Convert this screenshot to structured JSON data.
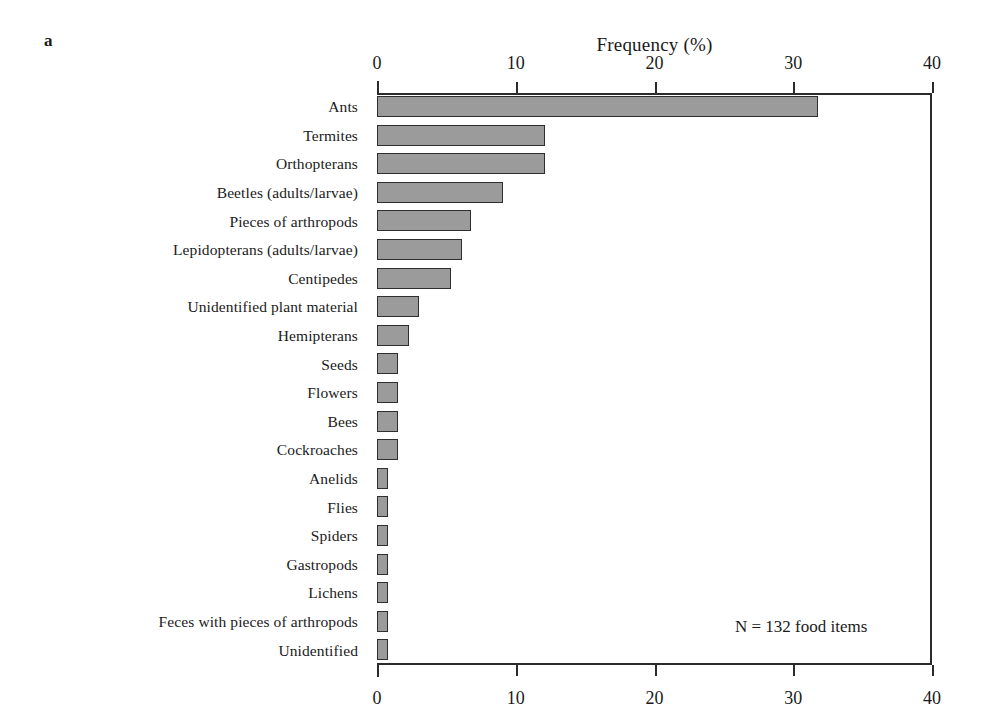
{
  "panel": {
    "label": "a"
  },
  "annotation": {
    "text": "N = 132 food items"
  },
  "style": {
    "bar_fill": "#9b9b9b",
    "bar_border": "#2e2e2e",
    "axis_color": "#2b2b2b",
    "background": "#ffffff"
  },
  "chart_data": {
    "type": "bar",
    "orientation": "horizontal",
    "title": "",
    "xlabel": "Frequency (%)",
    "ylabel": "",
    "xlim": [
      0,
      40
    ],
    "xticks": [
      0,
      10,
      20,
      30,
      40
    ],
    "xticklabels": [
      "0",
      "10",
      "20",
      "30",
      "40"
    ],
    "xticks_both_axes": true,
    "grid": false,
    "legend": null,
    "annotations": [
      "N = 132 food items"
    ],
    "categories": [
      "Ants",
      "Termites",
      "Orthopterans",
      "Beetles (adults/larvae)",
      "Pieces of arthropods",
      "Lepidopterans (adults/larvae)",
      "Centipedes",
      "Unidentified plant material",
      "Hemipterans",
      "Seeds",
      "Flowers",
      "Bees",
      "Cockroaches",
      "Anelids",
      "Flies",
      "Spiders",
      "Gastropods",
      "Lichens",
      "Feces with pieces of arthropods",
      "Unidentified"
    ],
    "values": [
      31.8,
      12.1,
      12.1,
      9.1,
      6.8,
      6.1,
      5.3,
      3.0,
      2.3,
      1.5,
      1.5,
      1.5,
      1.5,
      0.8,
      0.8,
      0.8,
      0.8,
      0.8,
      0.8,
      0.8
    ]
  }
}
